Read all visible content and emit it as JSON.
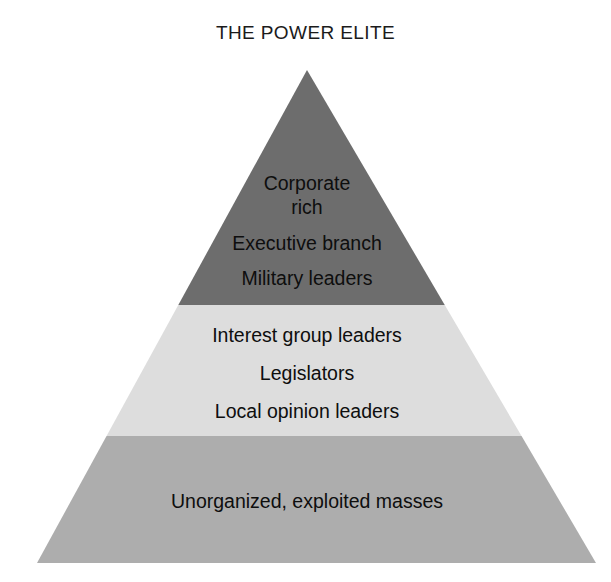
{
  "title": "THE POWER ELITE",
  "diagram": {
    "type": "pyramid",
    "background_color": "#ffffff",
    "text_color": "#0e0e0e",
    "apex": {
      "x": 307,
      "y": 70
    },
    "base": {
      "left_x": 37,
      "right_x": 596,
      "y": 563
    },
    "tiers": [
      {
        "id": "top",
        "name": "power-elite-tier",
        "color": "#6d6d6d",
        "top_y": 70,
        "bottom_y": 305,
        "lines": [
          "Corporate",
          "rich",
          "Executive branch",
          "Military leaders"
        ],
        "line_y": [
          190,
          214,
          250,
          285
        ]
      },
      {
        "id": "middle",
        "name": "middle-levels-tier",
        "color": "#dddddd",
        "top_y": 305,
        "bottom_y": 436,
        "lines": [
          "Interest group leaders",
          "Legislators",
          "Local opinion leaders"
        ],
        "line_y": [
          342,
          380,
          418
        ]
      },
      {
        "id": "bottom",
        "name": "masses-tier",
        "color": "#adadad",
        "top_y": 436,
        "bottom_y": 563,
        "lines": [
          "Unorganized, exploited masses"
        ],
        "line_y": [
          508
        ]
      }
    ]
  }
}
